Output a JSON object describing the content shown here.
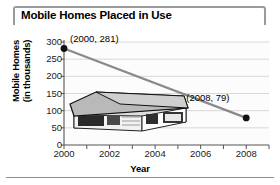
{
  "figure": {
    "title": "Mobile Homes Placed in Use",
    "illustration_name": "mobile-home-illustration"
  },
  "chart_data": {
    "type": "line",
    "title": "Mobile Homes Placed in Use",
    "xlabel": "Year",
    "ylabel": "Mobile Homes (in thousands)",
    "ylabel_line1": "Mobile Homes",
    "ylabel_line2": "(in thousands)",
    "x": [
      2000,
      2008
    ],
    "values": [
      281,
      79
    ],
    "series": [
      {
        "name": "Mobile homes placed in use",
        "points": [
          {
            "x": 2000,
            "y": 281
          },
          {
            "x": 2008,
            "y": 79
          }
        ]
      }
    ],
    "annotations": [
      {
        "text": "(2000, 281)",
        "x": 2000,
        "y": 281
      },
      {
        "text": "(2008, 79)",
        "x": 2008,
        "y": 79
      }
    ],
    "xlim": [
      2000,
      2009
    ],
    "ylim": [
      0,
      300
    ],
    "xticks": [
      2000,
      2002,
      2004,
      2006,
      2008
    ],
    "xtick_labels": [
      "2000",
      "2002",
      "2004",
      "2006",
      "2008"
    ],
    "xminor_ticks": [
      2001,
      2003,
      2005,
      2007,
      2009
    ],
    "yticks": [
      0,
      50,
      100,
      150,
      200,
      250,
      300
    ],
    "ytick_labels": [
      "0",
      "50",
      "100",
      "150",
      "200",
      "250",
      "300"
    ],
    "grid": "horizontal",
    "legend": "none",
    "line_color": "#8a8a8a",
    "marker_color": "#111111",
    "grid_color": "#d8d8d8",
    "axis_color": "#555555"
  }
}
